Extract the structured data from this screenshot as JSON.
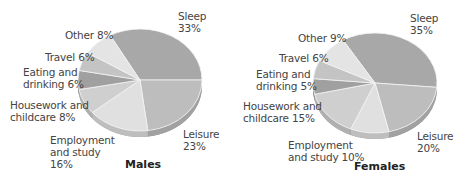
{
  "chart_data": [
    {
      "type": "pie",
      "title": "Males",
      "style": "3d-tilted",
      "slices": [
        {
          "label": "Sleep",
          "value": 33,
          "color": "#a8a8a8"
        },
        {
          "label": "Leisure",
          "value": 23,
          "color": "#bdbdbd"
        },
        {
          "label": "Employment and study",
          "value": 16,
          "color": "#e0e0e0"
        },
        {
          "label": "Housework and childcare",
          "value": 8,
          "color": "#cfcfcf"
        },
        {
          "label": "Eating and drinking",
          "value": 6,
          "color": "#a0a0a0"
        },
        {
          "label": "Travel",
          "value": 6,
          "color": "#c4c4c4"
        },
        {
          "label": "Other",
          "value": 8,
          "color": "#e4e4e4"
        }
      ]
    },
    {
      "type": "pie",
      "title": "Females",
      "style": "3d-tilted",
      "slices": [
        {
          "label": "Sleep",
          "value": 35,
          "color": "#a8a8a8"
        },
        {
          "label": "Leisure",
          "value": 20,
          "color": "#bdbdbd"
        },
        {
          "label": "Employment and study",
          "value": 10,
          "color": "#e0e0e0"
        },
        {
          "label": "Housework and childcare",
          "value": 15,
          "color": "#cfcfcf"
        },
        {
          "label": "Eating and drinking",
          "value": 5,
          "color": "#a0a0a0"
        },
        {
          "label": "Travel",
          "value": 6,
          "color": "#c4c4c4"
        },
        {
          "label": "Other",
          "value": 9,
          "color": "#e4e4e4"
        }
      ]
    }
  ],
  "males": {
    "title": "Males",
    "labels": {
      "sleep": [
        "Sleep",
        "33%"
      ],
      "leisure": [
        "Leisure",
        "23%"
      ],
      "employment": [
        "Employment",
        "and study",
        "16%"
      ],
      "housework": [
        "Housework and",
        "childcare 8%"
      ],
      "eating": [
        "Eating and",
        "drinking 6%"
      ],
      "travel": [
        "Travel 6%"
      ],
      "other": [
        "Other 8%"
      ]
    }
  },
  "females": {
    "title": "Females",
    "labels": {
      "sleep": [
        "Sleep",
        "35%"
      ],
      "leisure": [
        "Leisure",
        "20%"
      ],
      "employment": [
        "Employment",
        "and study 10%"
      ],
      "housework": [
        "Housework and",
        "childcare 15%"
      ],
      "eating": [
        "Eating and",
        "drinking 5%"
      ],
      "travel": [
        "Travel 6%"
      ],
      "other": [
        "Other 9%"
      ]
    }
  }
}
